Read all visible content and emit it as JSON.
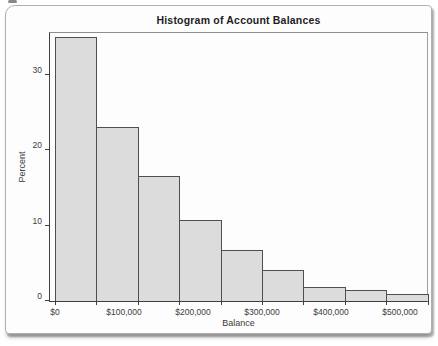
{
  "page": {
    "background": "#ffffff"
  },
  "card": {
    "background": "#fdfdfd",
    "border_color": "#b2b0ae"
  },
  "chart_data": {
    "type": "bar",
    "variant": "histogram",
    "title": "Histogram of Account Balances",
    "xlabel": "Balance",
    "ylabel": "Percent",
    "bin_width_dollars": 60000,
    "bin_edges_dollars": [
      0,
      60000,
      120000,
      180000,
      240000,
      300000,
      360000,
      420000,
      480000,
      540000
    ],
    "values": [
      35,
      23,
      16.5,
      10.7,
      6.7,
      4.1,
      1.8,
      1.4,
      0.9
    ],
    "x_tick_labels": [
      "$0",
      "$100,000",
      "$200,000",
      "$300,000",
      "$400,000",
      "$500,000"
    ],
    "x_tick_values": [
      0,
      100000,
      200000,
      300000,
      400000,
      500000
    ],
    "y_tick_labels": [
      "0",
      "10",
      "20",
      "30"
    ],
    "y_tick_values": [
      0,
      10,
      20,
      30
    ],
    "ylim": [
      0,
      35.8
    ],
    "xlim_dollars": [
      -7200,
      545000
    ],
    "grid": false,
    "legend": "none",
    "colors": {
      "bar_fill": "#dcdcdc",
      "bar_border": "#4f4f4f",
      "axis": "#3f3f3f",
      "frame": "#8f8f8f",
      "tick_text": "#3c3c3c",
      "axis_label_text": "#3a3a3a",
      "title_text": "#1d1d1d"
    }
  }
}
